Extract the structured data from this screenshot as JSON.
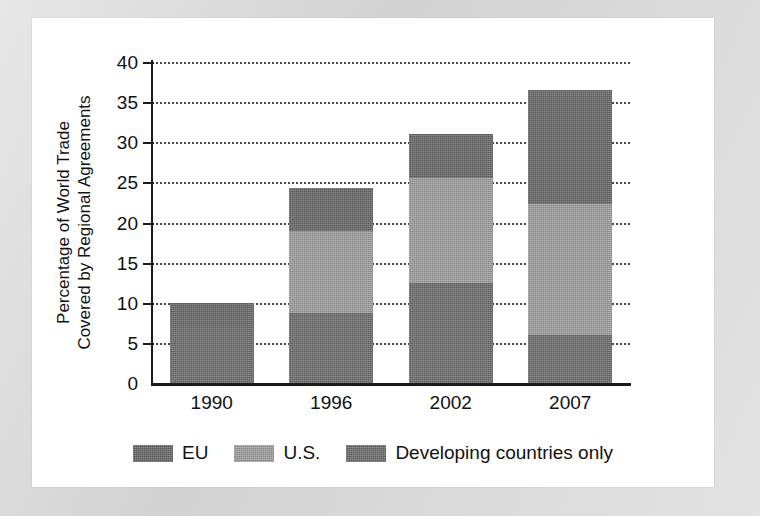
{
  "chart_data": {
    "type": "bar",
    "subtype": "stacked-bar",
    "title": "",
    "xlabel": "",
    "ylabel": "Percentage of World Trade Covered by Regional Agreements",
    "ylabel_lines": [
      "Percentage of World Trade",
      "Covered by Regional Agreements"
    ],
    "categories": [
      "1990",
      "1996",
      "2002",
      "2007"
    ],
    "ylim": [
      0,
      40
    ],
    "ytick_step": 5,
    "ytick_labels": [
      "40",
      "35",
      "30",
      "25",
      "20",
      "15",
      "10",
      "5",
      "0"
    ],
    "ytick_values": [
      40,
      35,
      30,
      25,
      20,
      15,
      10,
      5,
      0
    ],
    "grid": true,
    "grid_style": "dotted-horizontal",
    "legend_position": "bottom-center",
    "stack_order_bottom_to_top": [
      "Developing countries only",
      "U.S.",
      "EU"
    ],
    "series": [
      {
        "name": "Developing countries only",
        "key": "dev",
        "color": "#787878",
        "values": [
          7.0,
          8.7,
          12.5,
          6.0
        ]
      },
      {
        "name": "U.S.",
        "key": "us",
        "color": "#9d9d9d",
        "values": [
          0.0,
          10.3,
          13.0,
          16.3
        ]
      },
      {
        "name": "EU",
        "key": "eu",
        "color": "#6e6e6e",
        "values": [
          3.0,
          5.3,
          5.5,
          14.2
        ]
      }
    ],
    "totals": [
      10.0,
      24.3,
      31.0,
      36.5
    ],
    "cumulative_boundaries": {
      "1990": [
        7.0,
        7.0,
        10.0
      ],
      "1996": [
        8.7,
        19.0,
        24.3
      ],
      "2002": [
        12.5,
        25.5,
        31.0
      ],
      "2007": [
        6.0,
        22.3,
        36.5
      ]
    }
  },
  "legend": {
    "entries": [
      {
        "label": "EU",
        "key": "eu",
        "swatch_class": "seg-eu"
      },
      {
        "label": "U.S.",
        "key": "us",
        "swatch_class": "seg-us"
      },
      {
        "label": "Developing countries only",
        "key": "dev",
        "swatch_class": "seg-dev"
      }
    ]
  },
  "colors": {
    "eu": "#6e6e6e",
    "us": "#9d9d9d",
    "developing": "#787878",
    "axis": "#1a1a1a",
    "grid": "#4a4a4a",
    "panel": "#ffffff",
    "backdrop": "#d9d9d9"
  }
}
